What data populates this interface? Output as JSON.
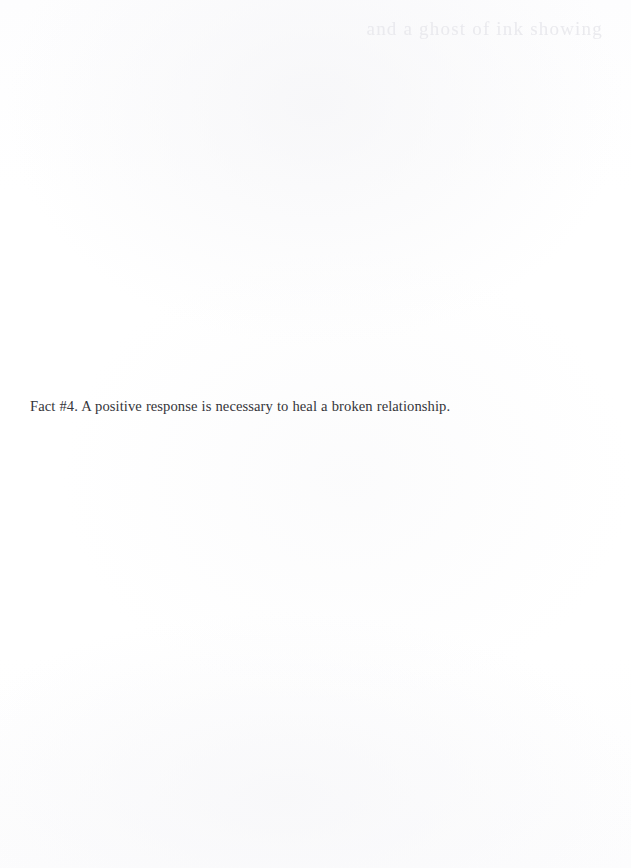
{
  "page": {
    "background_color": "#fefefe",
    "text_color": "#35353a",
    "width": 631,
    "height": 868
  },
  "content": {
    "body_line": "Fact #4. A positive response is necessary to heal a broken relationship."
  },
  "artifacts": {
    "bleed_through_text": "and a ghost of ink showing",
    "bleed_through_color": "#e8e8ec"
  }
}
